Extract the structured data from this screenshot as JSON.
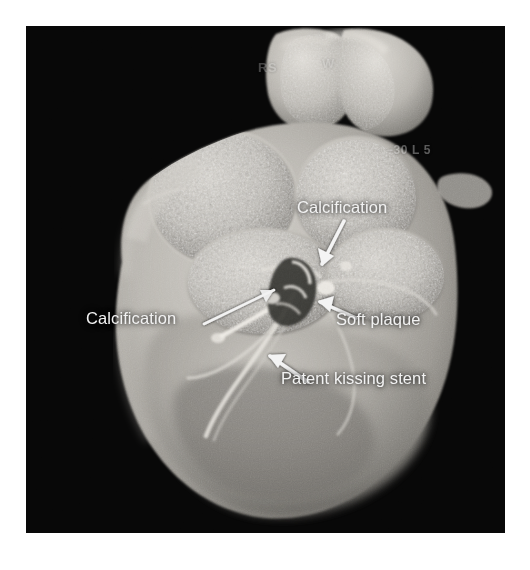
{
  "page": {
    "background_color": "#ffffff",
    "width": 530,
    "height": 570
  },
  "scan": {
    "modality": "cardiac-ct-volume-rendering",
    "frame_background_color": "#070707",
    "tissue_color": "#b9b7b2",
    "annotation_text_color": "#f2f2f2",
    "overlay_text_color": "#cfcfcf"
  },
  "overlay_text": {
    "top_left_burn_in": "RS",
    "top_right_burn_in": "W",
    "right_burn_in": "-30 L 5"
  },
  "annotations": [
    {
      "id": "calcification-upper",
      "label": "Calcification",
      "pointer": "arrow-down-left",
      "target": "right coronary / calcified plaque"
    },
    {
      "id": "calcification-lower",
      "label": "Calcification",
      "pointer": "line-up-right",
      "target": "proximal coronary calcification"
    },
    {
      "id": "soft-plaque",
      "label": "Soft plaque",
      "pointer": "arrow-up-left",
      "target": "non-calcified plaque at bifurcation"
    },
    {
      "id": "patent-stent",
      "label": "Patent kissing stent",
      "pointer": "arrow-up-left",
      "target": "kissing stent in coronary bifurcation"
    }
  ]
}
